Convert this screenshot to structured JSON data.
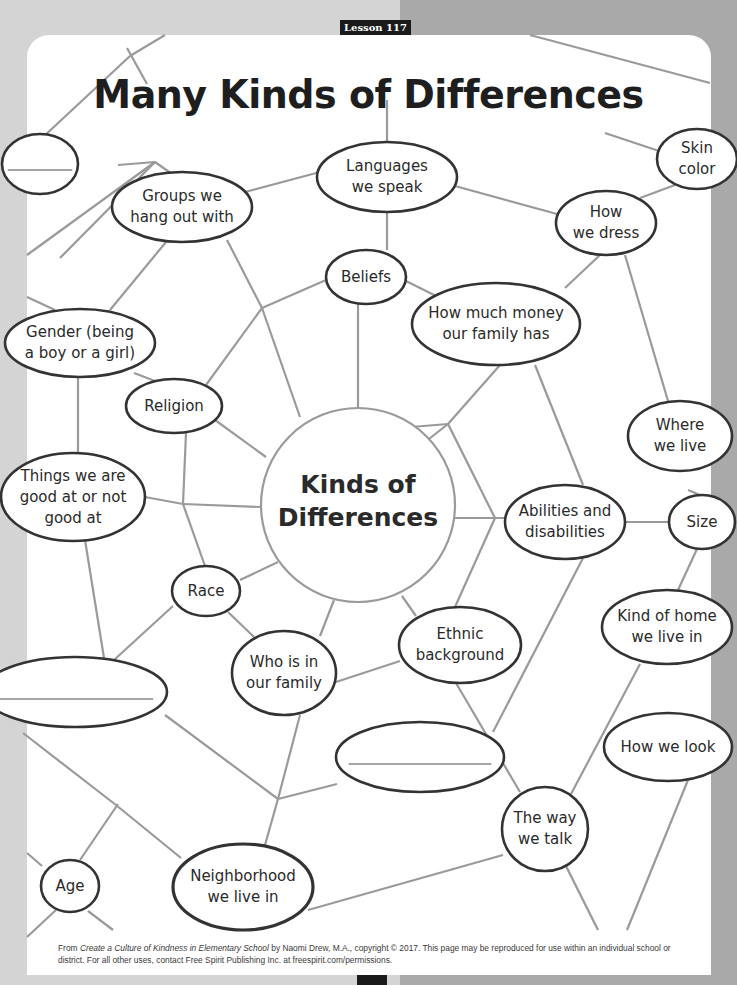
{
  "header": {
    "lesson_label": "Lesson 117",
    "title": "Many Kinds of Differences"
  },
  "colors": {
    "line": "#9a9a9a",
    "node_stroke": "#333333",
    "page": "#ffffff",
    "background": "#b9b9b9"
  },
  "center": {
    "label": "Kinds of\nDifferences",
    "cx": 358,
    "cy": 505,
    "r": 97
  },
  "nodes": [
    {
      "id": "blank-top-left",
      "label": "",
      "cx": 40,
      "cy": 164,
      "rx": 38,
      "ry": 30,
      "blank": true
    },
    {
      "id": "groups",
      "label": "Groups we\nhang out with",
      "cx": 182,
      "cy": 207,
      "rx": 70,
      "ry": 35
    },
    {
      "id": "languages",
      "label": "Languages\nwe speak",
      "cx": 387,
      "cy": 177,
      "rx": 70,
      "ry": 35
    },
    {
      "id": "skin-color",
      "label": "Skin\ncolor",
      "cx": 697,
      "cy": 159,
      "rx": 40,
      "ry": 30
    },
    {
      "id": "how-we-dress",
      "label": "How\nwe dress",
      "cx": 606,
      "cy": 223,
      "rx": 50,
      "ry": 32
    },
    {
      "id": "beliefs",
      "label": "Beliefs",
      "cx": 366,
      "cy": 277,
      "rx": 40,
      "ry": 27
    },
    {
      "id": "money",
      "label": "How much money\nour family has",
      "cx": 496,
      "cy": 324,
      "rx": 84,
      "ry": 41
    },
    {
      "id": "gender",
      "label": "Gender (being\na boy or a girl)",
      "cx": 80,
      "cy": 343,
      "rx": 75,
      "ry": 34
    },
    {
      "id": "religion",
      "label": "Religion",
      "cx": 174,
      "cy": 406,
      "rx": 48,
      "ry": 27
    },
    {
      "id": "where-we-live",
      "label": "Where\nwe live",
      "cx": 680,
      "cy": 436,
      "rx": 52,
      "ry": 35
    },
    {
      "id": "good-at",
      "label": "Things we are\ngood at or not\ngood at",
      "cx": 73,
      "cy": 497,
      "rx": 72,
      "ry": 44
    },
    {
      "id": "abilities",
      "label": "Abilities and\ndisabilities",
      "cx": 565,
      "cy": 522,
      "rx": 60,
      "ry": 37
    },
    {
      "id": "size",
      "label": "Size",
      "cx": 702,
      "cy": 522,
      "rx": 33,
      "ry": 27
    },
    {
      "id": "race",
      "label": "Race",
      "cx": 206,
      "cy": 591,
      "rx": 34,
      "ry": 25
    },
    {
      "id": "kind-of-home",
      "label": "Kind of home\nwe live in",
      "cx": 667,
      "cy": 627,
      "rx": 65,
      "ry": 37
    },
    {
      "id": "ethnic",
      "label": "Ethnic\nbackground",
      "cx": 460,
      "cy": 645,
      "rx": 61,
      "ry": 38
    },
    {
      "id": "blank-mid-left",
      "label": "",
      "cx": 75,
      "cy": 692,
      "rx": 92,
      "ry": 35,
      "blank": true
    },
    {
      "id": "family",
      "label": "Who is in\nour family",
      "cx": 284,
      "cy": 673,
      "rx": 52,
      "ry": 42
    },
    {
      "id": "how-we-look",
      "label": "How we look",
      "cx": 668,
      "cy": 747,
      "rx": 64,
      "ry": 34
    },
    {
      "id": "blank-mid-right",
      "label": "",
      "cx": 420,
      "cy": 757,
      "rx": 84,
      "ry": 35,
      "blank": true
    },
    {
      "id": "the-way-we-talk",
      "label": "The way\nwe talk",
      "cx": 545,
      "cy": 829,
      "rx": 43,
      "ry": 42
    },
    {
      "id": "age",
      "label": "Age",
      "cx": 70,
      "cy": 886,
      "rx": 29,
      "ry": 26
    },
    {
      "id": "neighborhood",
      "label": "Neighborhood\nwe live in",
      "cx": 243,
      "cy": 887,
      "rx": 70,
      "ry": 43
    }
  ],
  "edges": [
    [
      27,
      152,
      130,
      56
    ],
    [
      130,
      56,
      165,
      35
    ],
    [
      127,
      48,
      147,
      84
    ],
    [
      530,
      35,
      710,
      83
    ],
    [
      605,
      133,
      668,
      154
    ],
    [
      675,
      185,
      640,
      198
    ],
    [
      60,
      258,
      155,
      162
    ],
    [
      155,
      162,
      240,
      222
    ],
    [
      155,
      162,
      118,
      165
    ],
    [
      27,
      255,
      155,
      162
    ],
    [
      245,
      192,
      320,
      172
    ],
    [
      387,
      142,
      387,
      100
    ],
    [
      455,
      186,
      557,
      214
    ],
    [
      387,
      212,
      387,
      250
    ],
    [
      166,
      242,
      110,
      310
    ],
    [
      27,
      297,
      55,
      310
    ],
    [
      227,
      240,
      262,
      308
    ],
    [
      262,
      308,
      300,
      417
    ],
    [
      262,
      308,
      326,
      280
    ],
    [
      262,
      308,
      206,
      385
    ],
    [
      406,
      281,
      438,
      297
    ],
    [
      358,
      304,
      358,
      408
    ],
    [
      600,
      255,
      565,
      288
    ],
    [
      625,
      255,
      668,
      401
    ],
    [
      500,
      365,
      448,
      424
    ],
    [
      535,
      365,
      583,
      485
    ],
    [
      134,
      373,
      155,
      381
    ],
    [
      78,
      377,
      78,
      453
    ],
    [
      215,
      420,
      266,
      457
    ],
    [
      186,
      433,
      183,
      504
    ],
    [
      145,
      497,
      183,
      504
    ],
    [
      183,
      504,
      261,
      507
    ],
    [
      183,
      504,
      205,
      566
    ],
    [
      448,
      424,
      411,
      427
    ],
    [
      448,
      424,
      415,
      450
    ],
    [
      448,
      424,
      495,
      518
    ],
    [
      455,
      518,
      505,
      518
    ],
    [
      495,
      518,
      455,
      607
    ],
    [
      625,
      522,
      669,
      522
    ],
    [
      688,
      490,
      700,
      495
    ],
    [
      697,
      549,
      678,
      590
    ],
    [
      240,
      580,
      278,
      562
    ],
    [
      173,
      606,
      114,
      660
    ],
    [
      228,
      612,
      254,
      637
    ],
    [
      334,
      600,
      320,
      636
    ],
    [
      402,
      596,
      416,
      616
    ],
    [
      336,
      682,
      400,
      661
    ],
    [
      85,
      540,
      104,
      658
    ],
    [
      165,
      715,
      278,
      799
    ],
    [
      278,
      799,
      300,
      715
    ],
    [
      278,
      799,
      337,
      784
    ],
    [
      278,
      799,
      265,
      845
    ],
    [
      27,
      853,
      42,
      866
    ],
    [
      118,
      804,
      80,
      860
    ],
    [
      23,
      733,
      116,
      805
    ],
    [
      116,
      805,
      181,
      858
    ],
    [
      88,
      911,
      113,
      930
    ],
    [
      56,
      910,
      27,
      937
    ],
    [
      456,
      683,
      520,
      792
    ],
    [
      583,
      558,
      493,
      732
    ],
    [
      640,
      664,
      571,
      794
    ],
    [
      308,
      910,
      503,
      855
    ],
    [
      566,
      866,
      598,
      930
    ],
    [
      688,
      780,
      627,
      930
    ]
  ],
  "footer": {
    "prefix": "From ",
    "book_title": "Create a Culture of Kindness in Elementary School",
    "text": " by Naomi Drew, M.A., copyright © 2017. This page may be reproduced for use within an individual school or district. For all other uses, contact Free Spirit Publishing Inc. at freespirit.com/permissions."
  }
}
